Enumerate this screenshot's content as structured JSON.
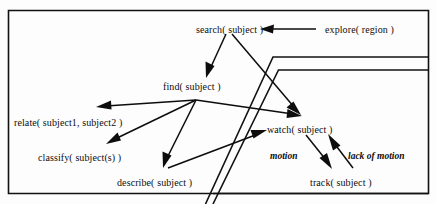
{
  "figure": {
    "background_color": "#fdfdfd",
    "ink_color": "#0d0d0d"
  },
  "nodes": [
    {
      "id": "search",
      "label": "search( subject )",
      "x": 196,
      "y": 25
    },
    {
      "id": "explore",
      "label": "explore( region )",
      "x": 325,
      "y": 25
    },
    {
      "id": "find",
      "label": "find( subject )",
      "x": 163,
      "y": 82
    },
    {
      "id": "relate",
      "label": "relate( subject1, subject2 )",
      "x": 14,
      "y": 118
    },
    {
      "id": "classify",
      "label": "classify( subject(s) )",
      "x": 38,
      "y": 153
    },
    {
      "id": "describe",
      "label": "describe( subject )",
      "x": 117,
      "y": 178
    },
    {
      "id": "watch",
      "label": "watch( subject )",
      "x": 267,
      "y": 125
    },
    {
      "id": "track",
      "label": "track( subject )",
      "x": 310,
      "y": 178
    }
  ],
  "edge_labels": [
    {
      "id": "motion",
      "label": "motion",
      "x": 270,
      "y": 152
    },
    {
      "id": "lack-of-motion",
      "label": "lack of motion",
      "x": 348,
      "y": 152
    }
  ],
  "edges": [
    {
      "id": "explore-to-search",
      "from": "explore",
      "to": "search",
      "label": ""
    },
    {
      "id": "search-to-find",
      "from": "search",
      "to": "find",
      "label": ""
    },
    {
      "id": "search-to-watch",
      "from": "search",
      "to": "watch",
      "label": ""
    },
    {
      "id": "find-to-relate",
      "from": "find",
      "to": "relate",
      "label": ""
    },
    {
      "id": "find-to-classify",
      "from": "find",
      "to": "classify",
      "label": ""
    },
    {
      "id": "find-to-describe",
      "from": "find",
      "to": "describe",
      "label": ""
    },
    {
      "id": "find-to-watch",
      "from": "find",
      "to": "watch",
      "label": ""
    },
    {
      "id": "describe-to-watch",
      "from": "describe",
      "to": "watch",
      "label": ""
    },
    {
      "id": "watch-to-track",
      "from": "watch",
      "to": "track",
      "label": "motion"
    },
    {
      "id": "track-to-watch",
      "from": "track",
      "to": "watch",
      "label": "lack of motion"
    }
  ]
}
